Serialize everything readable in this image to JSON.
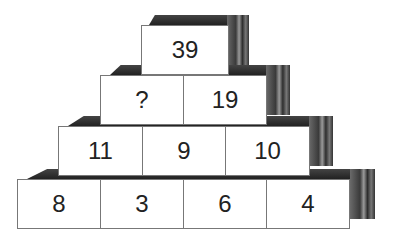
{
  "puzzle": {
    "type": "number-pyramid",
    "rows": [
      [
        "39"
      ],
      [
        "?",
        "19"
      ],
      [
        "11",
        "9",
        "10"
      ],
      [
        "8",
        "3",
        "6",
        "4"
      ]
    ],
    "unknown_symbol": "?"
  },
  "colors": {
    "face": "#ffffff",
    "border": "#777777",
    "shadow": "#333333",
    "text": "#222222"
  }
}
